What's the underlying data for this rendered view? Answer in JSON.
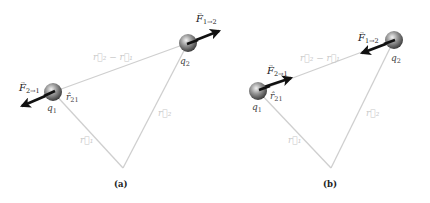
{
  "panels": [
    {
      "id": "a",
      "caption": "(a)",
      "force_direction": "repulsive",
      "charges": {
        "q1": {
          "name": "q",
          "sub": "1"
        },
        "q2": {
          "name": "q",
          "sub": "2"
        }
      },
      "labels": {
        "F21": {
          "name": "F",
          "sub": "2→1"
        },
        "F12": {
          "name": "F",
          "sub": "1→2"
        },
        "r21hat": {
          "name": "r̂",
          "sub": "21"
        },
        "r2minusr1": "r⃗₂ − r⃗₁",
        "r1": "r⃗₁",
        "r2": "r⃗₂"
      }
    },
    {
      "id": "b",
      "caption": "(b)",
      "force_direction": "attractive",
      "charges": {
        "q1": {
          "name": "q",
          "sub": "1"
        },
        "q2": {
          "name": "q",
          "sub": "2"
        }
      },
      "labels": {
        "F21": {
          "name": "F",
          "sub": "2→1"
        },
        "F12": {
          "name": "F",
          "sub": "1→2"
        },
        "r21hat": {
          "name": "r̂",
          "sub": "21"
        },
        "r2minusr1": "r⃗₂ − r⃗₁",
        "r1": "r⃗₁",
        "r2": "r⃗₂"
      }
    }
  ],
  "colors": {
    "vector_line": "#cfcfcf",
    "force_arrow": "#111111",
    "sphere_light": "#e8e8e8",
    "sphere_dark": "#555555"
  }
}
